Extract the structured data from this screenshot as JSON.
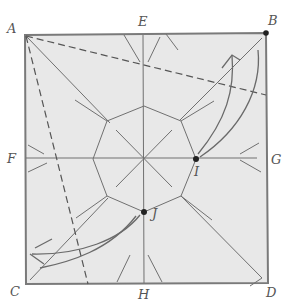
{
  "diagram": {
    "type": "origami crease pattern",
    "paper_color": "#e9e9e9",
    "line_color": "#6f6f6f",
    "labels": {
      "A": "A",
      "B": "B",
      "C": "C",
      "D": "D",
      "E": "E",
      "F": "F",
      "G": "G",
      "H": "H",
      "I": "I",
      "J": "J"
    },
    "points": {
      "A": [
        25,
        35
      ],
      "B": [
        266,
        33
      ],
      "C": [
        26,
        284
      ],
      "D": [
        268,
        283
      ],
      "E": [
        143,
        34
      ],
      "F": [
        25,
        158
      ],
      "G": [
        267,
        158
      ],
      "H": [
        144,
        284
      ],
      "I": [
        196,
        159
      ],
      "J": [
        144,
        212
      ],
      "center": [
        144,
        158
      ]
    },
    "marked_points": [
      "B",
      "I",
      "J"
    ],
    "valley_folds": [
      "A to point on right edge (dashed)",
      "A to point on bottom edge (dashed)"
    ],
    "arrows": [
      "I curving up toward B",
      "J curving down-left toward C"
    ]
  }
}
